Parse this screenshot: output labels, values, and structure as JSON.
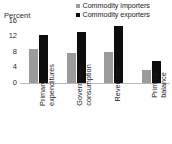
{
  "chart": {
    "axis_title": "Percent",
    "y_ticks": [
      "16",
      "12",
      "8",
      "4",
      "0"
    ],
    "legend": [
      {
        "label": "Commodity importers",
        "color": "#9b9b9b",
        "marker": "square-marker-gray"
      },
      {
        "label": "Commodity exporters",
        "color": "#0d0d0d",
        "marker": "square-marker-black"
      }
    ],
    "categories": [
      {
        "line1": "Primary",
        "line2": "expenditures"
      },
      {
        "line1": "Government",
        "line2": "consumption"
      },
      {
        "line1": "Revenues",
        "line2": ""
      },
      {
        "line1": "Primary",
        "line2": "balance"
      }
    ]
  },
  "chart_data": {
    "type": "bar",
    "title": "",
    "subtitle": "",
    "xlabel": "",
    "ylabel": "Percent",
    "ylim": [
      0,
      16
    ],
    "yticks": [
      0,
      4,
      8,
      12,
      16
    ],
    "grid": false,
    "legend_position": "top-right",
    "categories": [
      "Primary expenditures",
      "Government consumption",
      "Revenues",
      "Primary balance"
    ],
    "series": [
      {
        "name": "Commodity importers",
        "color": "#9b9b9b",
        "values": [
          8.6,
          7.6,
          7.9,
          3.2
        ]
      },
      {
        "name": "Commodity exporters",
        "color": "#0d0d0d",
        "values": [
          12.2,
          12.9,
          14.5,
          5.7
        ]
      }
    ]
  }
}
